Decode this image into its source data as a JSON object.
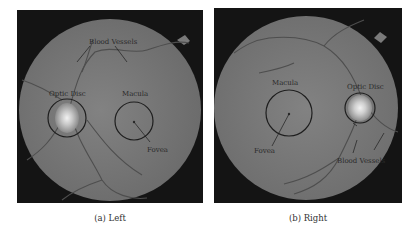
{
  "figure": {
    "panels": [
      {
        "id": "left",
        "caption": "(a) Left",
        "labels": {
          "blood_vessels": "Blood Vessels",
          "optic_disc": "Optic Disc",
          "macula": "Macula",
          "fovea": "Fovea"
        }
      },
      {
        "id": "right",
        "caption": "(b) Right",
        "labels": {
          "blood_vessels": "Blood Vessels",
          "optic_disc": "Optic Disc",
          "macula": "Macula",
          "fovea": "Fovea"
        }
      }
    ],
    "colors": {
      "background": "#141414",
      "fundus": "#7a7a7a",
      "optic_disc": "#e6e6e6",
      "annotation": "#1e1e1e"
    }
  }
}
